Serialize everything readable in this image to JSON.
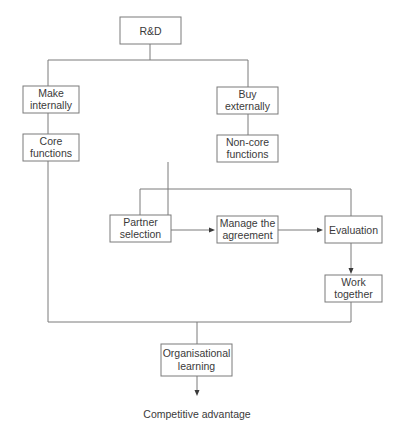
{
  "diagram": {
    "type": "flowchart",
    "nodes": {
      "rd": {
        "lines": [
          "R&D"
        ]
      },
      "make_internally": {
        "lines": [
          "Make",
          "internally"
        ]
      },
      "buy_externally": {
        "lines": [
          "Buy",
          "externally"
        ]
      },
      "core_functions": {
        "lines": [
          "Core",
          "functions"
        ]
      },
      "non_core_functions": {
        "lines": [
          "Non-core",
          "functions"
        ]
      },
      "partner_selection": {
        "lines": [
          "Partner",
          "selection"
        ]
      },
      "manage_agreement": {
        "lines": [
          "Manage the",
          "agreement"
        ]
      },
      "evaluation": {
        "lines": [
          "Evaluation"
        ]
      },
      "work_together": {
        "lines": [
          "Work",
          "together"
        ]
      },
      "organisational_learning": {
        "lines": [
          "Organisational",
          "learning"
        ]
      },
      "competitive_advantage": {
        "lines": [
          "Competitive advantage"
        ]
      }
    },
    "edges": [
      {
        "from": "R&D",
        "to": "Make internally",
        "arrow": false
      },
      {
        "from": "R&D",
        "to": "Buy externally",
        "arrow": false
      },
      {
        "from": "Make internally",
        "to": "Core functions",
        "arrow": false
      },
      {
        "from": "Buy externally",
        "to": "Non-core functions",
        "arrow": false
      },
      {
        "from": "Non-core functions",
        "to": "Partner selection",
        "arrow": false
      },
      {
        "from": "Non-core functions",
        "to": "Manage the agreement",
        "arrow": false
      },
      {
        "from": "Non-core functions",
        "to": "Evaluation",
        "arrow": false
      },
      {
        "from": "Partner selection",
        "to": "Manage the agreement",
        "arrow": true
      },
      {
        "from": "Manage the agreement",
        "to": "Evaluation",
        "arrow": true
      },
      {
        "from": "Evaluation",
        "to": "Work together",
        "arrow": true
      },
      {
        "from": "Core functions",
        "to": "Organisational learning",
        "arrow": false
      },
      {
        "from": "Work together",
        "to": "Organisational learning",
        "arrow": false
      },
      {
        "from": "Organisational learning",
        "to": "Competitive advantage",
        "arrow": true
      }
    ]
  }
}
